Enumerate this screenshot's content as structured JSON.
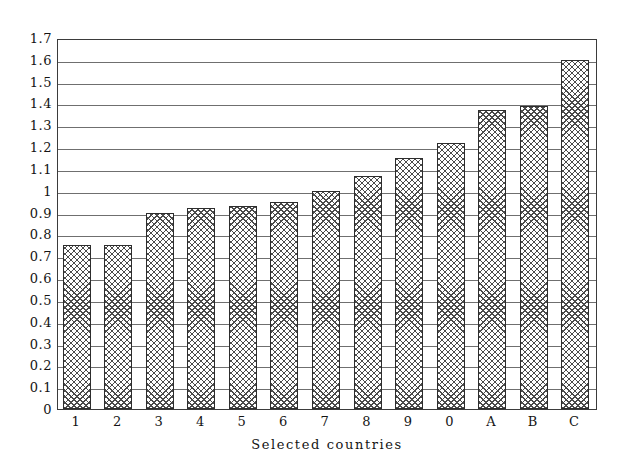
{
  "chart_data": {
    "type": "bar",
    "title": "",
    "subtitle": "",
    "xlabel": "Selected countries",
    "ylabel": "",
    "categories": [
      "1",
      "2",
      "3",
      "4",
      "5",
      "6",
      "7",
      "8",
      "9",
      "0",
      "A",
      "B",
      "C"
    ],
    "values": [
      0.75,
      0.75,
      0.9,
      0.92,
      0.93,
      0.95,
      1.0,
      1.07,
      1.15,
      1.22,
      1.37,
      1.39,
      1.6
    ],
    "series": [
      {
        "name": "Selected countries",
        "values": [
          0.75,
          0.75,
          0.9,
          0.92,
          0.93,
          0.95,
          1.0,
          1.07,
          1.15,
          1.22,
          1.37,
          1.39,
          1.6
        ]
      }
    ],
    "ylim": [
      0,
      1.7
    ],
    "ytick_labels": [
      "0",
      "0.1",
      "0.2",
      "0.3",
      "0.4",
      "0.5",
      "0.6",
      "0.7",
      "0.8",
      "0.9",
      "1",
      "1.1",
      "1.2",
      "1.3",
      "1.4",
      "1.5",
      "1.6",
      "1.7"
    ],
    "ytick_values": [
      0,
      0.1,
      0.2,
      0.3,
      0.4,
      0.5,
      0.6,
      0.7,
      0.8,
      0.9,
      1.0,
      1.1,
      1.2,
      1.3,
      1.4,
      1.5,
      1.6,
      1.7
    ],
    "grid": true,
    "grid_axis": "y",
    "legend": false,
    "legend_position": "none",
    "bar_fill": "cross-hatch",
    "colors": {
      "bar_edge": "#2d2d2d",
      "bar_hatch": "#4a4a4a",
      "gridline": "#6f6f6f",
      "frame": "#3b3b3b",
      "background": "#ffffff",
      "text": "#141414"
    }
  }
}
